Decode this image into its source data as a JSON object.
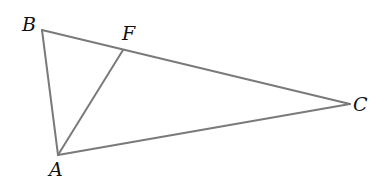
{
  "diagram": {
    "type": "triangle",
    "line_color": "#7a7a7a",
    "label_color": "#111111",
    "points": {
      "A": {
        "label": "A",
        "x": 58,
        "y": 155
      },
      "B": {
        "label": "B",
        "x": 42,
        "y": 30
      },
      "C": {
        "label": "C",
        "x": 350,
        "y": 104
      },
      "F": {
        "label": "F",
        "x": 123,
        "y": 50
      }
    },
    "segments": [
      {
        "name": "AB",
        "from": "A",
        "to": "B"
      },
      {
        "name": "BC",
        "from": "B",
        "to": "C"
      },
      {
        "name": "CA",
        "from": "C",
        "to": "A"
      },
      {
        "name": "AF",
        "from": "A",
        "to": "F"
      }
    ]
  }
}
